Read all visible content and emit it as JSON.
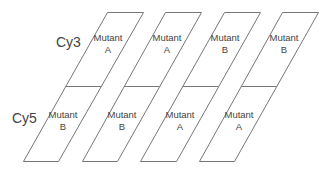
{
  "rows": {
    "top": "Cy3",
    "bottom": "Cy5"
  },
  "slides": [
    {
      "top": [
        "Mutant",
        "A"
      ],
      "bottom": [
        "Mutant",
        "B"
      ]
    },
    {
      "top": [
        "Mutant",
        "A"
      ],
      "bottom": [
        "Mutant",
        "B"
      ]
    },
    {
      "top": [
        "Mutant",
        "B"
      ],
      "bottom": [
        "Mutant",
        "A"
      ]
    },
    {
      "top": [
        "Mutant",
        "B"
      ],
      "bottom": [
        "Mutant",
        "A"
      ]
    }
  ],
  "colors": {
    "stroke": "#777777",
    "text": "#444444"
  }
}
